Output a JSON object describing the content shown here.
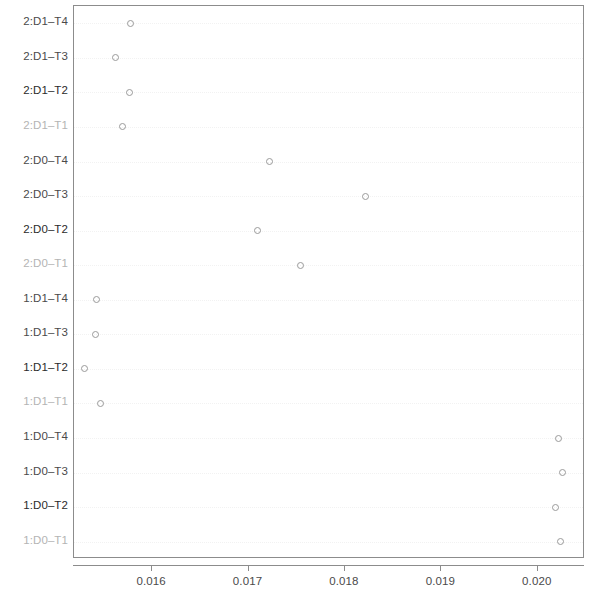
{
  "chart_data": {
    "type": "scatter",
    "title": "",
    "subtitle": "",
    "xlabel": "",
    "ylabel": "",
    "grid": true,
    "legend": null,
    "legend_position": "none",
    "orientation": "horizontal",
    "marker": "open-circle",
    "xlim": [
      0.01519,
      0.02049
    ],
    "xticks": [
      0.016,
      0.017,
      0.018,
      0.019,
      0.02
    ],
    "xtick_labels": [
      "0.016",
      "0.017",
      "0.018",
      "0.019",
      "0.020"
    ],
    "categories": [
      "2:D1-T4",
      "2:D1-T3",
      "2:D1-T2",
      "2:D1-T1",
      "2:D0-T4",
      "2:D0-T3",
      "2:D0-T2",
      "2:D0-T1",
      "1:D1-T4",
      "1:D1-T3",
      "1:D1-T2",
      "1:D1-T1",
      "1:D0-T4",
      "1:D0-T3",
      "1:D0-T2",
      "1:D0-T1"
    ],
    "values": [
      0.01578,
      0.01562,
      0.01577,
      0.01569,
      0.01722,
      0.01821,
      0.01709,
      0.01754,
      0.01542,
      0.01541,
      0.0153,
      0.01546,
      0.02021,
      0.02026,
      0.02018,
      0.02024
    ]
  },
  "style": {
    "point_stroke": "#9a9a9a",
    "axis_color": "#8c8c8c",
    "label_color": "#4a4a4a",
    "gridline_color": "#f2f2f2",
    "background": "#ffffff"
  }
}
